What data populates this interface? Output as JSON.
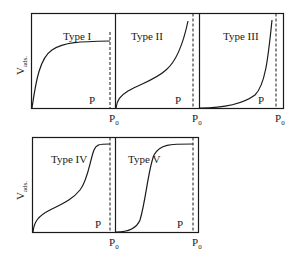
{
  "diagram": {
    "y_axis_label": "V",
    "y_axis_subscript": "ads.",
    "x_axis_label": "P",
    "saturation_label": "P",
    "saturation_subscript": "0",
    "panels": [
      {
        "id": "type-1",
        "label": "Type I",
        "shape": "rapid rise then plateau"
      },
      {
        "id": "type-2",
        "label": "Type II",
        "shape": "knee, linear middle, steep rise near P0"
      },
      {
        "id": "type-3",
        "label": "Type III",
        "shape": "convex, steep rise near P0"
      },
      {
        "id": "type-4",
        "label": "Type IV",
        "shape": "knee, linear middle, step up then plateau"
      },
      {
        "id": "type-5",
        "label": "Type V",
        "shape": "convex start, sigmoidal step, plateau"
      }
    ]
  }
}
